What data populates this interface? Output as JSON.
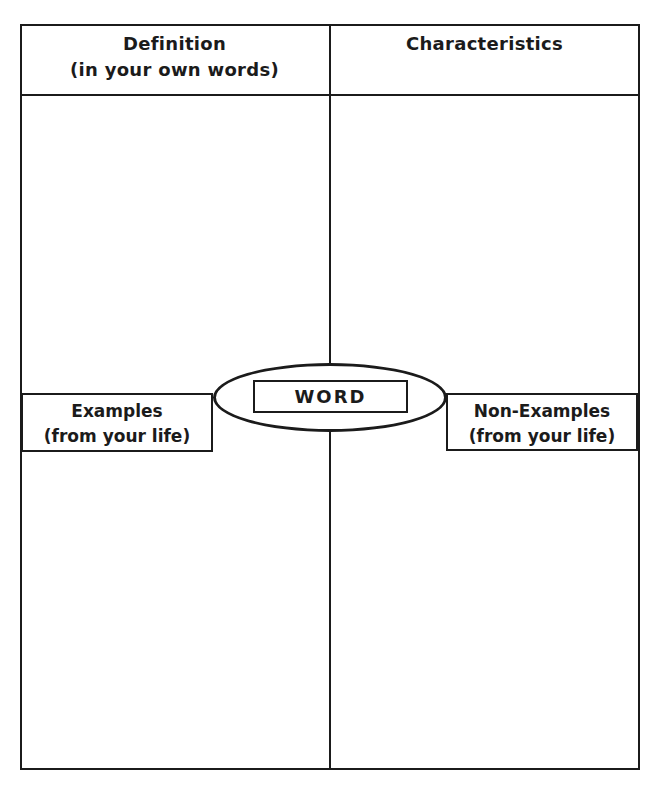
{
  "worksheet": {
    "type": "frayer-model-graphic-organizer",
    "labels": {
      "definition": {
        "title": "Definition",
        "subtitle": "(in your own words)"
      },
      "characteristics": {
        "title": "Characteristics"
      },
      "examples": {
        "title": "Examples",
        "subtitle": "(from your life)"
      },
      "non_examples": {
        "title": "Non-Examples",
        "subtitle": "(from your life)"
      },
      "center_word": "WORD"
    },
    "colors": {
      "ink": "#1b1b1b",
      "paper": "#ffffff"
    }
  }
}
